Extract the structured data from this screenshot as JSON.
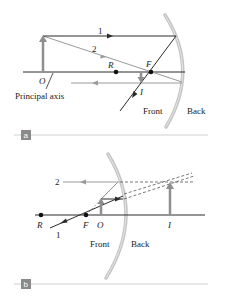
{
  "figure_a": {
    "badge": "a",
    "labels": {
      "ray1": "1",
      "ray2": "2",
      "object": "O",
      "center": "R",
      "focal": "F",
      "image": "I",
      "axis": "Principal axis",
      "front": "Front",
      "back": "Back"
    }
  },
  "figure_b": {
    "badge": "b",
    "labels": {
      "ray1": "1",
      "ray2": "2",
      "center": "R",
      "focal": "F",
      "object": "O",
      "image": "I",
      "front": "Front",
      "back": "Back"
    }
  },
  "colors": {
    "ray_dark": "#2b2b2b",
    "ray_gray": "#9a9a9a",
    "mirror": "#c4c4c4",
    "arrow_gray": "#8f8f8f",
    "badge": "#8a8a8a",
    "divider": "#d0d0d0"
  }
}
